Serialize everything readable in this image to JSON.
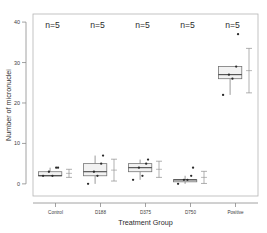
{
  "chart_data": {
    "type": "box",
    "title": "",
    "xlabel": "Treatment Group",
    "ylabel": "Number of micronuclei",
    "categories": [
      "Control",
      "D188",
      "D375",
      "D750",
      "Positive"
    ],
    "yticks": [
      0,
      10,
      20,
      30,
      40
    ],
    "ylim": [
      -3,
      42
    ],
    "grid": false,
    "legend": null,
    "annotations": [
      "n=5",
      "n=5",
      "n=5",
      "n=5",
      "n=5"
    ],
    "boxes": [
      {
        "category": "Control",
        "min": 2,
        "q1": 2,
        "median": 2,
        "q3": 3,
        "max": 4,
        "whisker_low": 2,
        "whisker_high": 4,
        "points": [
          2,
          2,
          3,
          4,
          4
        ],
        "mean": 2.6,
        "sd": 1.0
      },
      {
        "category": "D188",
        "min": 0,
        "q1": 2,
        "median": 3,
        "q3": 5,
        "max": 7,
        "whisker_low": 0,
        "whisker_high": 7,
        "points": [
          0,
          2,
          3,
          5,
          7
        ],
        "mean": 3.4,
        "sd": 2.7
      },
      {
        "category": "D375",
        "min": 1,
        "q1": 3,
        "median": 4,
        "q3": 5,
        "max": 6,
        "whisker_low": 1,
        "whisker_high": 6,
        "points": [
          1,
          2,
          4,
          5,
          6
        ],
        "mean": 3.6,
        "sd": 2.0
      },
      {
        "category": "D750",
        "min": 0,
        "q1": 1,
        "median": 1,
        "q3": 1,
        "max": 4,
        "whisker_low": 0,
        "whisker_high": 2,
        "points": [
          0,
          1,
          1,
          2,
          4
        ],
        "mean": 1.6,
        "sd": 1.5
      },
      {
        "category": "Positive",
        "min": 22,
        "q1": 26,
        "median": 27,
        "q3": 29,
        "max": 37,
        "whisker_low": 22,
        "whisker_high": 29,
        "points": [
          22,
          26,
          27,
          29,
          37
        ],
        "mean": 28,
        "sd": 5.5
      }
    ],
    "errorbars": [
      {
        "category": "Control",
        "mean": 2.6,
        "low": 1.6,
        "high": 3.6
      },
      {
        "category": "D188",
        "mean": 3.4,
        "low": 0.7,
        "high": 6.1
      },
      {
        "category": "D375",
        "mean": 3.6,
        "low": 1.6,
        "high": 5.6
      },
      {
        "category": "D750",
        "mean": 1.6,
        "low": 0.1,
        "high": 3.1
      },
      {
        "category": "Positive",
        "mean": 28,
        "low": 22.5,
        "high": 33.5
      }
    ]
  },
  "colors": {
    "box_fill": "#f2f2f2",
    "box_stroke": "#6e6e6e",
    "median": "#3a3a3a",
    "point": "#2a2a2a",
    "errorbar": "#8f8f8f",
    "axis": "#8a8a8a",
    "frame": "#b5b5b5",
    "text": "#2b2b2b",
    "background": "#ffffff"
  }
}
